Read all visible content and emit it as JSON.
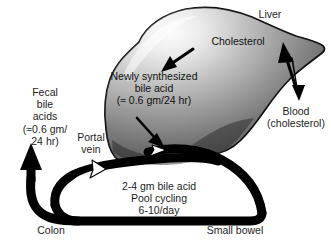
{
  "diagram": {
    "title_visible": false,
    "labels": {
      "liver": "Liver",
      "cholesterol": "Cholesterol",
      "blood": "Blood\n(cholesterol)",
      "newly_synthesized": "Newly synthesized\nbile acid\n(≈ 0.6 gm/24 hr)",
      "fecal": "Fecal\nbile\nacids\n(≈0.6 gm/\n24 hr)",
      "portal_vein": "Portal\nvein",
      "pool_cycling": "2-4 gm bile acid\nPool cycling\n6-10/day",
      "colon": "Colon",
      "small_bowel": "Small bowel"
    },
    "colors": {
      "background": "#ffffff",
      "ink": "#1d1d1d",
      "duct": "#000000",
      "liver_light": "#f2f2f2",
      "liver_mid": "#9a9a9a",
      "liver_dark": "#3a3a3a",
      "liver_outline": "#0d0d0d"
    },
    "arrows": {
      "cholesterol_to_bile": "arrow pointing down-left from Cholesterol label into liver",
      "blood_to_liver": "thick arrow pointing up-left from blood into liver",
      "liver_to_blood": "thin arrow pointing down to Blood (cholesterol)",
      "bile_acid_to_duct": "thin arrow pointing down-right from bile acid text to duct",
      "portal_vein_flow": "white outlined arrow pointing up-right along portal vein",
      "fecal_excretion": "thick black arrow pointing up at Colon exit"
    }
  }
}
